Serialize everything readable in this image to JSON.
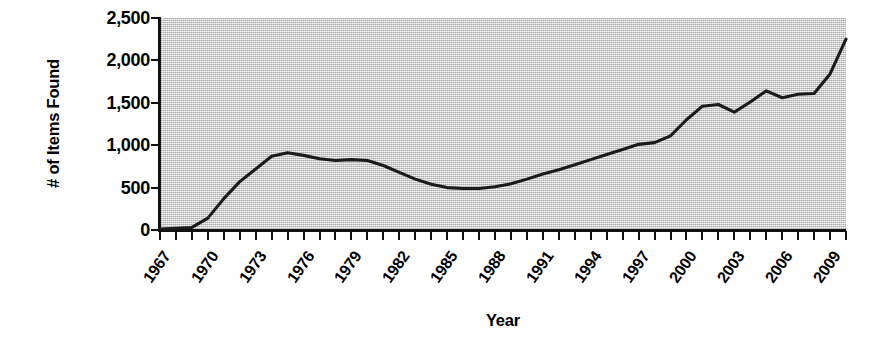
{
  "chart_data": {
    "type": "line",
    "title": "",
    "xlabel": "Year",
    "ylabel": "# of Items Found",
    "xlim": [
      1967,
      2010
    ],
    "ylim": [
      0,
      2500
    ],
    "grid": false,
    "legend": null,
    "y_ticks": [
      {
        "value": 2500,
        "label": "2,500"
      },
      {
        "value": 2000,
        "label": "2,000"
      },
      {
        "value": 1500,
        "label": "1,500"
      },
      {
        "value": 1000,
        "label": "1,000"
      },
      {
        "value": 500,
        "label": "500"
      },
      {
        "value": 0,
        "label": "0"
      }
    ],
    "x_tick_labels": [
      {
        "value": 1967,
        "label": "1967"
      },
      {
        "value": 1970,
        "label": "1970"
      },
      {
        "value": 1973,
        "label": "1973"
      },
      {
        "value": 1976,
        "label": "1976"
      },
      {
        "value": 1979,
        "label": "1979"
      },
      {
        "value": 1982,
        "label": "1982"
      },
      {
        "value": 1985,
        "label": "1985"
      },
      {
        "value": 1988,
        "label": "1988"
      },
      {
        "value": 1991,
        "label": "1991"
      },
      {
        "value": 1994,
        "label": "1994"
      },
      {
        "value": 1997,
        "label": "1997"
      },
      {
        "value": 2000,
        "label": "2000"
      },
      {
        "value": 2003,
        "label": "2003"
      },
      {
        "value": 2006,
        "label": "2006"
      },
      {
        "value": 2009,
        "label": "2009"
      }
    ],
    "x": [
      1967,
      1968,
      1969,
      1970,
      1971,
      1972,
      1973,
      1974,
      1975,
      1976,
      1977,
      1978,
      1979,
      1980,
      1981,
      1982,
      1983,
      1984,
      1985,
      1986,
      1987,
      1988,
      1989,
      1990,
      1991,
      1992,
      1993,
      1994,
      1995,
      1996,
      1997,
      1998,
      1999,
      2000,
      2001,
      2002,
      2003,
      2004,
      2005,
      2006,
      2007,
      2008,
      2009,
      2010
    ],
    "values": [
      10,
      20,
      30,
      140,
      370,
      570,
      720,
      870,
      910,
      880,
      840,
      820,
      830,
      820,
      760,
      680,
      600,
      540,
      500,
      490,
      490,
      510,
      545,
      600,
      660,
      710,
      770,
      830,
      890,
      950,
      1010,
      1030,
      1110,
      1300,
      1460,
      1480,
      1390,
      1510,
      1640,
      1560,
      1600,
      1610,
      1840,
      2250
    ],
    "series_color": "#1a1a1a",
    "plot_background_color": "#c9c9c9",
    "axis_color": "#111111"
  },
  "axis": {
    "y_title": "# of Items Found",
    "x_title": "Year"
  }
}
